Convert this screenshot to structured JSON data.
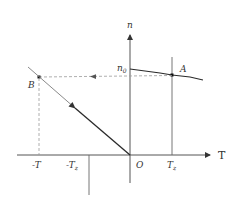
{
  "diagram": {
    "axes": {
      "x_label": "T",
      "y_label": "n",
      "origin_label": "O"
    },
    "x_ticks": [
      "-T",
      "-T",
      "T"
    ],
    "x_tick_labels": {
      "neg_T": "-T",
      "neg_Tz_main": "-T",
      "neg_Tz_sub": "z",
      "Tz_main": "T",
      "Tz_sub": "z"
    },
    "y_marker": {
      "main": "n",
      "sub": "0"
    },
    "points": {
      "A": "A",
      "B": "B"
    },
    "colors": {
      "line": "#2a2a2a",
      "light_line": "#8a8a8a",
      "dashed": "#9a9a9a",
      "axis": "#555555"
    }
  }
}
